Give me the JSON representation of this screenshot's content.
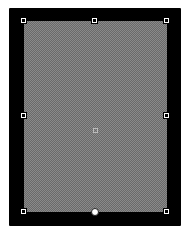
{
  "selection": {
    "frame_color": "#000000",
    "fill_pattern": "checker-gray",
    "fill_colors": [
      "#6a6a6a",
      "#8a8a8a"
    ],
    "handles": [
      {
        "id": "top-left",
        "x": 24,
        "y": 21,
        "type": "resize"
      },
      {
        "id": "top-middle",
        "x": 95,
        "y": 21,
        "type": "resize"
      },
      {
        "id": "top-right",
        "x": 167,
        "y": 21,
        "type": "resize"
      },
      {
        "id": "middle-left",
        "x": 24,
        "y": 116,
        "type": "resize"
      },
      {
        "id": "middle-right",
        "x": 167,
        "y": 116,
        "type": "resize"
      },
      {
        "id": "bottom-left",
        "x": 24,
        "y": 212,
        "type": "resize"
      },
      {
        "id": "bottom-middle",
        "x": 95,
        "y": 212,
        "type": "rotate"
      },
      {
        "id": "bottom-right",
        "x": 167,
        "y": 212,
        "type": "resize"
      }
    ],
    "center": {
      "x": 95,
      "y": 130
    }
  }
}
